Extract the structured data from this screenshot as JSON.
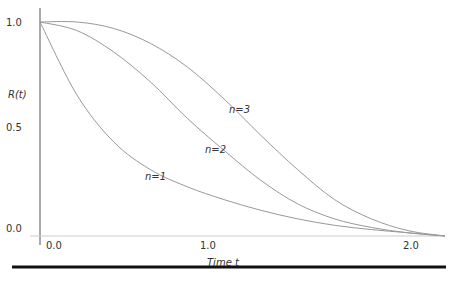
{
  "chart_data": {
    "type": "line",
    "title": "",
    "xlabel": "Time t",
    "ylabel": "R(t)",
    "xlim": [
      0,
      2.2
    ],
    "ylim": [
      0,
      1.0
    ],
    "x_ticks": [
      "0.0",
      "1.0",
      "2.0"
    ],
    "y_ticks": [
      "0.0",
      "0.5",
      "1.0"
    ],
    "grid": false,
    "legend": "inline labels",
    "x": [
      0,
      0.2,
      0.4,
      0.6,
      0.8,
      1.0,
      1.2,
      1.4,
      1.6,
      1.8,
      2.0,
      2.2
    ],
    "series": [
      {
        "name": "n=1",
        "values": [
          1.0,
          0.66,
          0.44,
          0.31,
          0.23,
          0.17,
          0.12,
          0.08,
          0.05,
          0.03,
          0.015,
          0.0
        ]
      },
      {
        "name": "n=2",
        "values": [
          1.0,
          0.96,
          0.86,
          0.72,
          0.55,
          0.4,
          0.26,
          0.15,
          0.08,
          0.04,
          0.015,
          0.0
        ]
      },
      {
        "name": "n=3",
        "values": [
          1.0,
          1.0,
          0.97,
          0.9,
          0.79,
          0.64,
          0.47,
          0.31,
          0.17,
          0.08,
          0.025,
          0.0
        ]
      }
    ]
  },
  "labels": {
    "ylabel": "R(t)",
    "xlabel": "Time t",
    "y1": "1.0",
    "y05": "0.5",
    "y0": "0.0",
    "x0": "0.0",
    "x1": "1.0",
    "x2": "2.0",
    "n1": "n=1",
    "n2": "n=2",
    "n3": "n=3"
  }
}
